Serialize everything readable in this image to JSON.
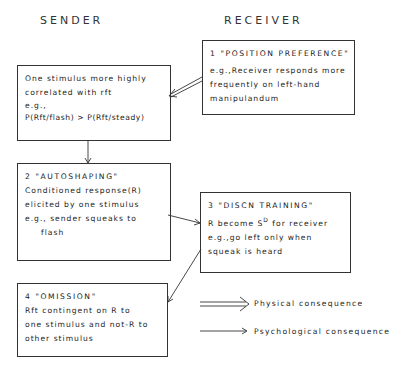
{
  "headers": {
    "sender": "SENDER",
    "receiver": "RECEIVER"
  },
  "boxes": {
    "sender_correlation": {
      "lines": [
        "One stimulus more highly",
        "correlated with rft",
        "e.g.,",
        "P(Rft/flash) > P(Rft/steady)"
      ]
    },
    "position_preference": {
      "title": "1 \"POSITION PREFERENCE\"",
      "lines": [
        "e.g.,Receiver responds more",
        "frequently on left-hand",
        "manipulandum"
      ]
    },
    "autoshaping": {
      "title": "2 \"AUTOSHAPING\"",
      "lines": [
        "Conditioned response(R)",
        "elicited by one stimulus",
        "e.g., sender squeaks to",
        "flash"
      ]
    },
    "discn_training": {
      "title": "3 \"DISCN TRAINING\"",
      "line1_pre": "R become S",
      "line1_sup": "D",
      "line1_post": " for receiver",
      "lines": [
        "e.g.,go left only when",
        "squeak is heard"
      ]
    },
    "omission": {
      "title": "4 \"OMISSION\"",
      "lines": [
        "Rft contingent on R to",
        "one stimulus and not-R to",
        "other stimulus"
      ]
    }
  },
  "legend": {
    "physical": "Physical consequence",
    "psychological": "Psychological consequence"
  },
  "connections": [
    {
      "from": "position_preference",
      "to": "sender_correlation",
      "type": "physical"
    },
    {
      "from": "sender_correlation",
      "to": "autoshaping",
      "type": "psychological"
    },
    {
      "from": "autoshaping",
      "to": "discn_training",
      "type": "psychological"
    },
    {
      "from": "discn_training",
      "to": "omission",
      "type": "psychological"
    }
  ]
}
